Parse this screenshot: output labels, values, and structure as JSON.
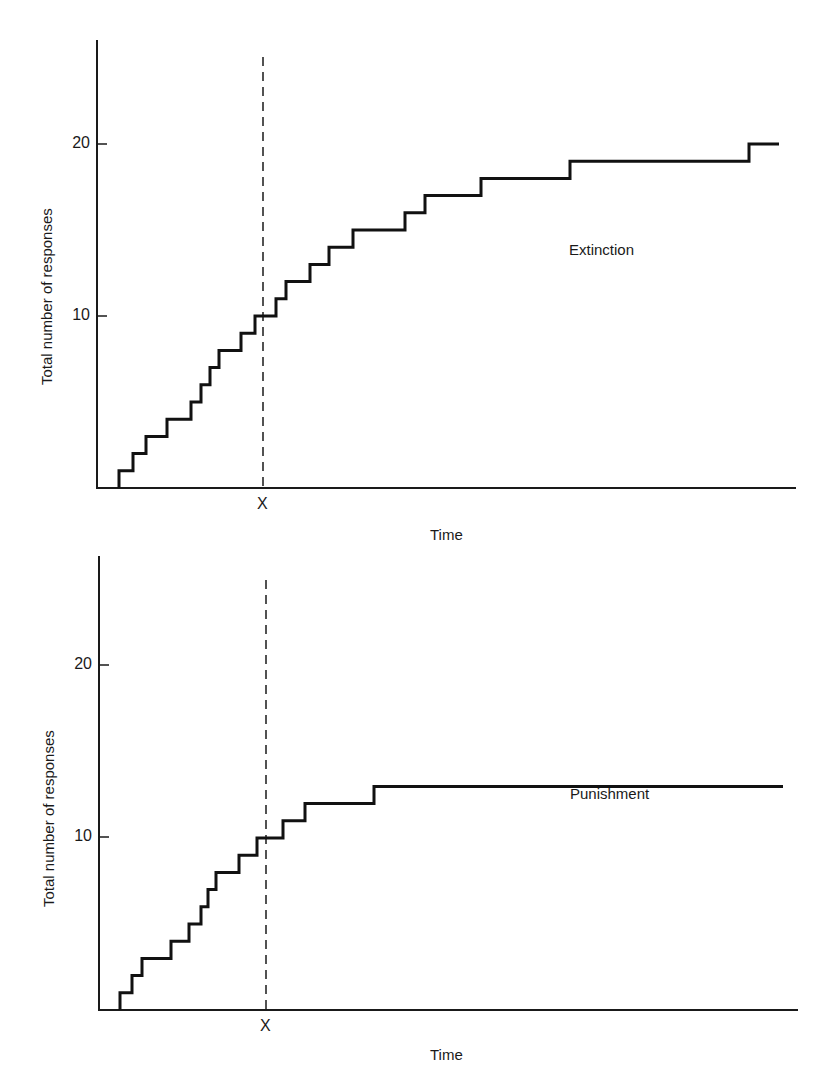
{
  "chart_data": [
    {
      "type": "line",
      "subtype": "cumulative-record-step",
      "title": "Extinction",
      "series_label": "Extinction",
      "xlabel": "Time",
      "ylabel": "Total number of responses",
      "x_marker": "X",
      "x_marker_position_px": 263,
      "yticks": [
        10,
        20
      ],
      "ylim": [
        0,
        25
      ],
      "grid": false,
      "step_x_px": [
        119,
        133,
        146,
        167,
        191,
        201,
        210,
        219,
        241,
        255,
        276,
        286,
        310,
        329,
        353,
        405,
        425,
        481,
        570,
        749
      ],
      "end_x_px": 779,
      "values": [
        1,
        2,
        3,
        4,
        5,
        6,
        7,
        8,
        9,
        10,
        11,
        12,
        13,
        14,
        15,
        16,
        17,
        18,
        19,
        20
      ],
      "note": "Cumulative responses; slope decreases gradually after point X (extinction)"
    },
    {
      "type": "line",
      "subtype": "cumulative-record-step",
      "title": "Punishment",
      "series_label": "Punishment",
      "xlabel": "Time",
      "ylabel": "Total number of responses",
      "x_marker": "X",
      "x_marker_position_px": 266,
      "yticks": [
        10,
        20
      ],
      "ylim": [
        0,
        25
      ],
      "grid": false,
      "step_x_px": [
        120,
        132,
        142,
        171,
        189,
        201,
        208,
        216,
        239,
        257,
        283,
        305,
        374
      ],
      "end_x_px": 783,
      "values": [
        1,
        2,
        3,
        4,
        5,
        6,
        7,
        8,
        9,
        10,
        11,
        12,
        13
      ],
      "note": "Cumulative responses; responding stops abruptly shortly after point X (punishment)"
    }
  ],
  "labels": {
    "top": {
      "ylabel": "Total number of responses",
      "tick_20": "20",
      "tick_10": "10",
      "x_marker": "X",
      "xlabel": "Time",
      "series": "Extinction"
    },
    "bottom": {
      "ylabel": "Total number of responses",
      "tick_20": "20",
      "tick_10": "10",
      "x_marker": "X",
      "xlabel": "Time",
      "series": "Punishment"
    }
  }
}
